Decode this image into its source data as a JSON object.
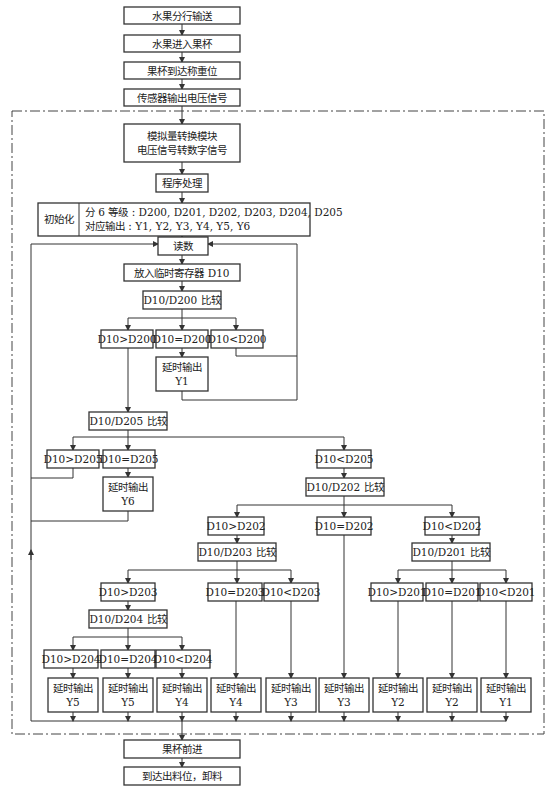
{
  "nodes": {
    "n1": "水果分行输送",
    "n2": "水果进入果杯",
    "n3": "果杯到达称重位",
    "n4": "传感器输出电压信号",
    "adc": [
      "模拟量转换模块",
      "电压信号转数字信号"
    ],
    "prog": "程序处理",
    "init_label": "初始化",
    "init_text": [
      "分 6 等级 : D200, D201, D202, D203, D204, D205",
      "对应输出 : Y1, Y2, Y3, Y4, Y5, Y6"
    ],
    "read": "读数",
    "store": "放入临时寄存器 D10",
    "cmp200": "D10/D200 比较",
    "gt200": "D10>D200",
    "eq200": "D10=D200",
    "lt200": "D10<D200",
    "out_y1_a": [
      "延时输出",
      "Y1"
    ],
    "cmp205": "D10/D205 比较",
    "gt205": "D10>D205",
    "eq205": "D10=D205",
    "lt205": "D10<D205",
    "out_y6": [
      "延时输出",
      "Y6"
    ],
    "cmp202": "D10/D202 比较",
    "gt202": "D10>D202",
    "eq202": "D10=D202",
    "lt202": "D10<D202",
    "cmp203": "D10/D203 比较",
    "cmp201": "D10/D201 比较",
    "gt203": "D10>D203",
    "eq203": "D10=D203",
    "lt203": "D10<D203",
    "gt201": "D10>D201",
    "eq201": "D10=D201",
    "lt201": "D10<D201",
    "cmp204": "D10/D204 比较",
    "gt204": "D10>D204",
    "eq204": "D10=D204",
    "lt204": "D10<D204",
    "outputs": [
      [
        "延时输出",
        "Y5"
      ],
      [
        "延时输出",
        "Y5"
      ],
      [
        "延时输出",
        "Y4"
      ],
      [
        "延时输出",
        "Y4"
      ],
      [
        "延时输出",
        "Y3"
      ],
      [
        "延时输出",
        "Y3"
      ],
      [
        "延时输出",
        "Y2"
      ],
      [
        "延时输出",
        "Y2"
      ],
      [
        "延时输出",
        "Y1"
      ]
    ],
    "advance": "果杯前进",
    "unload": "到达出料位，卸料"
  }
}
